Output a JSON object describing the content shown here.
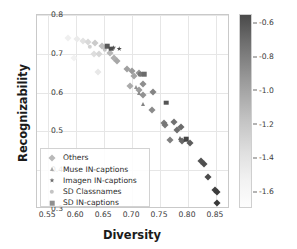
{
  "chart_data": {
    "type": "scatter",
    "title": "",
    "xlabel": "Diversity",
    "ylabel": "Recognizability",
    "xlim": [
      0.53,
      0.875
    ],
    "ylim": [
      0.3,
      0.8
    ],
    "xticks": [
      "0.55",
      "0.60",
      "0.65",
      "0.70",
      "0.75",
      "0.80",
      "0.85"
    ],
    "xtick_values": [
      0.55,
      0.6,
      0.65,
      0.7,
      0.75,
      0.8,
      0.85
    ],
    "yticks": [
      "0.3",
      "0.4",
      "0.5",
      "0.6",
      "0.7",
      "0.8"
    ],
    "ytick_values": [
      0.3,
      0.4,
      0.5,
      0.6,
      0.7,
      0.8
    ],
    "grid": true,
    "legend_position": "lower left",
    "colorbar": {
      "label": "Performance at 1.3M (negative log loss)",
      "ticks": [
        "-0.6",
        "-0.8",
        "-1.0",
        "-1.2",
        "-1.4",
        "-1.6"
      ],
      "tick_values": [
        -0.6,
        -0.8,
        -1.0,
        -1.2,
        -1.4,
        -1.6
      ],
      "vmin": -1.7,
      "vmax": -0.55,
      "cmap": "greys_reversed",
      "dark_color": "#4a4a4a",
      "light_color": "#fdfdfd"
    },
    "series": [
      {
        "name": "Others",
        "marker": "diamond",
        "points": [
          {
            "x": 0.585,
            "y": 0.74,
            "c": -1.62
          },
          {
            "x": 0.601,
            "y": 0.737,
            "c": -1.6
          },
          {
            "x": 0.613,
            "y": 0.733,
            "c": -1.55
          },
          {
            "x": 0.622,
            "y": 0.731,
            "c": -1.5
          },
          {
            "x": 0.597,
            "y": 0.69,
            "c": -1.64
          },
          {
            "x": 0.633,
            "y": 0.727,
            "c": -1.42
          },
          {
            "x": 0.631,
            "y": 0.7,
            "c": -1.52
          },
          {
            "x": 0.641,
            "y": 0.699,
            "c": -1.48
          },
          {
            "x": 0.647,
            "y": 0.719,
            "c": -1.35
          },
          {
            "x": 0.639,
            "y": 0.652,
            "c": -1.58
          },
          {
            "x": 0.661,
            "y": 0.703,
            "c": -1.3
          },
          {
            "x": 0.667,
            "y": 0.69,
            "c": -1.26
          },
          {
            "x": 0.673,
            "y": 0.681,
            "c": -1.22
          },
          {
            "x": 0.691,
            "y": 0.661,
            "c": -1.18
          },
          {
            "x": 0.7,
            "y": 0.656,
            "c": -1.14
          },
          {
            "x": 0.712,
            "y": 0.651,
            "c": -1.12
          },
          {
            "x": 0.704,
            "y": 0.642,
            "c": -1.2
          },
          {
            "x": 0.697,
            "y": 0.617,
            "c": -1.24
          },
          {
            "x": 0.713,
            "y": 0.607,
            "c": -1.16
          },
          {
            "x": 0.719,
            "y": 0.621,
            "c": -1.08
          },
          {
            "x": 0.72,
            "y": 0.593,
            "c": -1.1
          },
          {
            "x": 0.737,
            "y": 0.601,
            "c": -1.02
          },
          {
            "x": 0.735,
            "y": 0.556,
            "c": -1.06
          },
          {
            "x": 0.757,
            "y": 0.522,
            "c": -0.98
          },
          {
            "x": 0.759,
            "y": 0.517,
            "c": -0.96
          },
          {
            "x": 0.775,
            "y": 0.524,
            "c": -0.92
          },
          {
            "x": 0.781,
            "y": 0.504,
            "c": -0.9
          },
          {
            "x": 0.787,
            "y": 0.511,
            "c": -0.88
          },
          {
            "x": 0.768,
            "y": 0.477,
            "c": -1.0
          },
          {
            "x": 0.79,
            "y": 0.475,
            "c": -0.86
          },
          {
            "x": 0.803,
            "y": 0.469,
            "c": -0.8
          },
          {
            "x": 0.823,
            "y": 0.424,
            "c": -0.74
          },
          {
            "x": 0.829,
            "y": 0.416,
            "c": -0.72
          },
          {
            "x": 0.836,
            "y": 0.383,
            "c": -0.7
          },
          {
            "x": 0.848,
            "y": 0.349,
            "c": -0.64
          },
          {
            "x": 0.852,
            "y": 0.345,
            "c": -0.62
          },
          {
            "x": 0.851,
            "y": 0.315,
            "c": -0.6
          }
        ]
      },
      {
        "name": "Muse IN-captions",
        "marker": "triangle",
        "points": [
          {
            "x": 0.707,
            "y": 0.614,
            "c": -1.1
          },
          {
            "x": 0.712,
            "y": 0.599,
            "c": -1.06
          },
          {
            "x": 0.719,
            "y": 0.57,
            "c": -1.02
          },
          {
            "x": 0.786,
            "y": 0.482,
            "c": -0.84
          }
        ]
      },
      {
        "name": "Imagen IN-captions",
        "marker": "star",
        "points": [
          {
            "x": 0.677,
            "y": 0.713,
            "c": -0.7
          },
          {
            "x": 0.667,
            "y": 0.716,
            "c": -0.8
          }
        ]
      },
      {
        "name": "SD Classnames",
        "marker": "circle",
        "points": [
          {
            "x": 0.624,
            "y": 0.718,
            "c": -1.46
          },
          {
            "x": 0.651,
            "y": 0.712,
            "c": -1.38
          },
          {
            "x": 0.715,
            "y": 0.647,
            "c": -0.95
          },
          {
            "x": 0.758,
            "y": 0.52,
            "c": -0.94
          }
        ]
      },
      {
        "name": "SD IN-captions",
        "marker": "square",
        "points": [
          {
            "x": 0.655,
            "y": 0.719,
            "c": -0.78
          },
          {
            "x": 0.663,
            "y": 0.713,
            "c": -0.72
          },
          {
            "x": 0.722,
            "y": 0.648,
            "c": -0.88
          },
          {
            "x": 0.761,
            "y": 0.574,
            "c": -0.76
          },
          {
            "x": 0.797,
            "y": 0.48,
            "c": -0.66
          }
        ]
      }
    ]
  },
  "legend": {
    "items": [
      {
        "label": "Others",
        "marker": "diamond",
        "color": "#b9b9b9"
      },
      {
        "label": "Muse IN-captions",
        "marker": "triangle",
        "color": "#a8a8a8"
      },
      {
        "label": "Imagen IN-captions",
        "marker": "star",
        "color": "#6e6e6e"
      },
      {
        "label": "SD Classnames",
        "marker": "circle",
        "color": "#c4c4c4"
      },
      {
        "label": "SD IN-captions",
        "marker": "square",
        "color": "#8f8f8f"
      }
    ]
  }
}
